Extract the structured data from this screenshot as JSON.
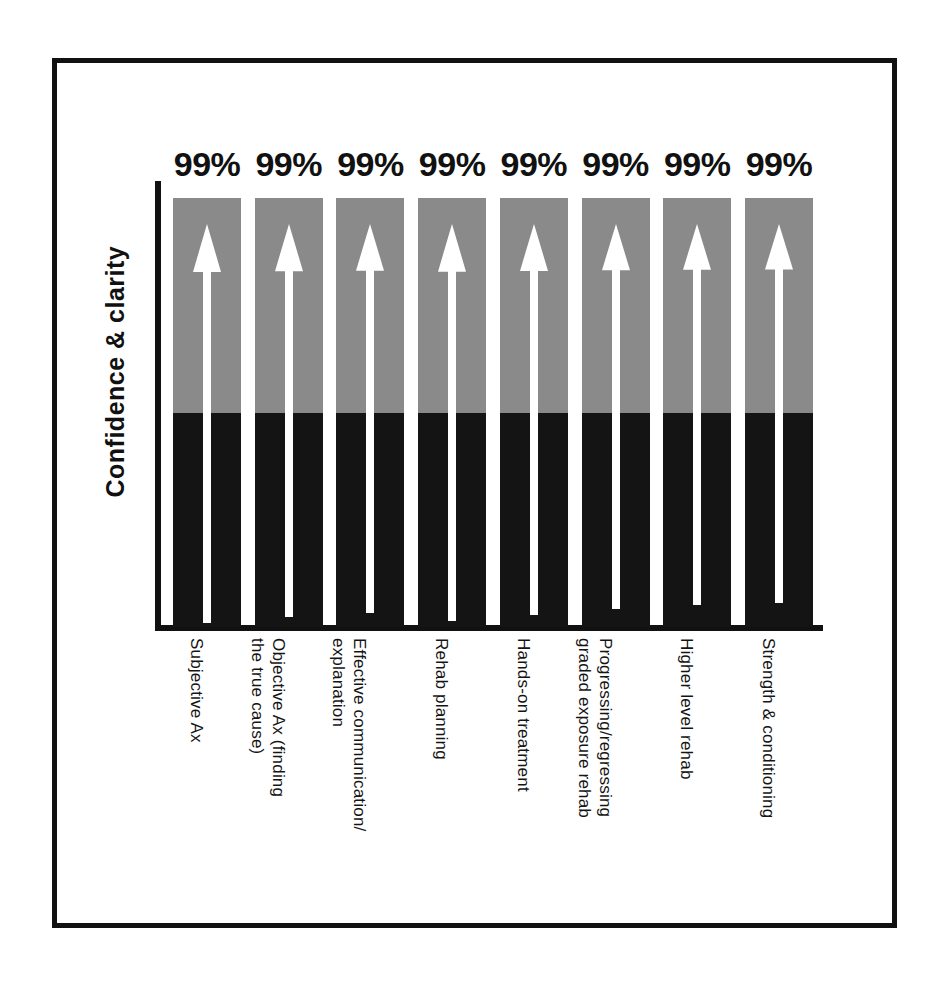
{
  "chart_data": {
    "type": "bar",
    "title": "",
    "subtitle": "",
    "xlabel": "",
    "ylabel": "Confidence & clarity",
    "ylim": [
      0,
      100
    ],
    "grid": false,
    "legend": "none",
    "value_suffix": "%",
    "categories": [
      "Subjective Ax",
      "Objective Ax (finding the true cause)",
      "Effective communication/ explanation",
      "Rehab planning",
      "Hands-on treatment",
      "Progressing/regressing graded exposure rehab",
      "Higher level rehab",
      "Strength & conditioning"
    ],
    "category_lines": [
      [
        "Subjective Ax",
        ""
      ],
      [
        "Objective Ax (finding",
        "the true cause)"
      ],
      [
        "Effective communication/",
        "explanation"
      ],
      [
        "Rehab planning",
        ""
      ],
      [
        "Hands-on treatment",
        ""
      ],
      [
        "Progressing/regressing",
        "graded exposure rehab"
      ],
      [
        "Higher level rehab",
        ""
      ],
      [
        "Strength & conditioning",
        ""
      ]
    ],
    "values": [
      99,
      99,
      99,
      99,
      99,
      99,
      99,
      99
    ],
    "value_labels": [
      "99%",
      "99%",
      "99%",
      "99%",
      "99%",
      "99%",
      "99%",
      "99%"
    ],
    "segments": {
      "upper_label": "grey segment",
      "lower_label": "black segment",
      "upper_fraction": 0.5,
      "lower_fraction": 0.5
    },
    "annotations": [
      "white upward arrow inside each bar",
      "white upward arrow inside each bar",
      "white upward arrow inside each bar",
      "white upward arrow inside each bar",
      "white upward arrow inside each bar",
      "white upward arrow inside each bar",
      "white upward arrow inside each bar",
      "white upward arrow inside each bar"
    ]
  },
  "colors": {
    "bar_upper": "#8a8a8a",
    "bar_lower": "#141414",
    "axis": "#111111",
    "frame": "#111111",
    "arrow": "#ffffff",
    "background": "#ffffff",
    "text": "#141414"
  }
}
